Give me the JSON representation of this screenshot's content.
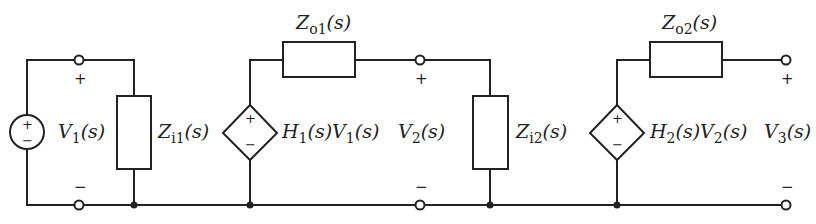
{
  "diagram": {
    "type": "cascaded two-stage circuit",
    "stroke_color": "#222222",
    "components": {
      "source": {
        "label_main": "V",
        "label_sub": "1",
        "label_arg": "(s)",
        "signs": [
          "+",
          "−"
        ]
      },
      "zi1": {
        "label_main": "Z",
        "label_sub": "i1",
        "label_arg": "(s)"
      },
      "dep1": {
        "label": "H",
        "sub1": "1",
        "mid": "(s)V",
        "sub2": "1",
        "arg": "(s)",
        "signs": [
          "+",
          "−"
        ]
      },
      "zo1": {
        "label_main": "Z",
        "label_sub": "o1",
        "label_arg": "(s)"
      },
      "v2": {
        "label_main": "V",
        "label_sub": "2",
        "label_arg": "(s)",
        "plus": "+",
        "minus": "−"
      },
      "zi2": {
        "label_main": "Z",
        "label_sub": "i2",
        "label_arg": "(s)"
      },
      "dep2": {
        "label": "H",
        "sub1": "2",
        "mid": "(s)V",
        "sub2": "2",
        "arg": "(s)",
        "signs": [
          "+",
          "−"
        ]
      },
      "zo2": {
        "label_main": "Z",
        "label_sub": "o2",
        "label_arg": "(s)"
      },
      "v3": {
        "label_main": "V",
        "label_sub": "3",
        "label_arg": "(s)",
        "plus": "+",
        "minus": "−"
      },
      "v1_terminal": {
        "plus": "+",
        "minus": "−"
      }
    }
  }
}
